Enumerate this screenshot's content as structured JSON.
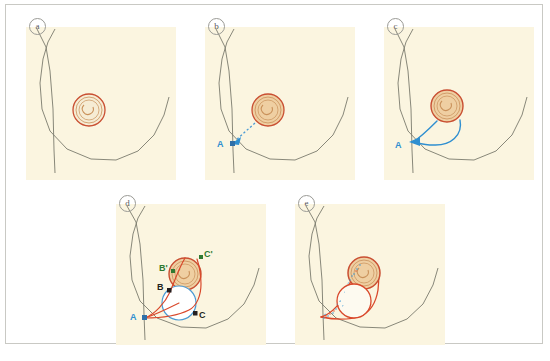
{
  "figure": {
    "type": "surgical-technique-diagram",
    "panel_count": 5,
    "background_color": "#ffffff",
    "frame_border_color": "#c9c9c4",
    "skin_fill_color": "#fbf5e0",
    "skin_outline_color": "#7b7a6d",
    "areola_outline_color": "#c94f32",
    "areola_fill_color": "#efcfa2",
    "areola_inner_color": "#c9915a",
    "marker_blue": "#2f8fd0",
    "marker_red": "#d9482b",
    "marker_green": "#2f7a32",
    "marker_dark": "#231f20",
    "stipple_color": "#3f9bd6"
  },
  "panels": [
    {
      "id": "a",
      "label": "a",
      "caption_letter": "a",
      "description": "Baseline breast outline with nipple-areola complex, no markings",
      "point_labels": []
    },
    {
      "id": "b",
      "label": "b",
      "caption_letter": "b",
      "description": "Dotted blue arrow from areola toward inferolateral point A",
      "point_labels": [
        {
          "text": "A",
          "color": "#2f8fd0"
        }
      ]
    },
    {
      "id": "c",
      "label": "c",
      "caption_letter": "c",
      "description": "Two blue curved incision lines converging at point A from the areola",
      "point_labels": [
        {
          "text": "A",
          "color": "#2f8fd0"
        }
      ]
    },
    {
      "id": "d",
      "label": "d",
      "caption_letter": "d",
      "description": "Geometric planning: points A, B, C on lesion circle and transposed points B-prime and C-prime on areola",
      "point_labels": [
        {
          "text": "A",
          "color": "#2f8fd0"
        },
        {
          "text": "B",
          "color": "#231f20"
        },
        {
          "text": "C",
          "color": "#231f20"
        },
        {
          "text": "B'",
          "color": "#2f7a32"
        },
        {
          "text": "C'",
          "color": "#2f7a32"
        }
      ]
    },
    {
      "id": "e",
      "label": "e",
      "caption_letter": "e",
      "description": "Final excision outline in red with stippled de-epithelialised area between areola and lesion",
      "point_labels": []
    }
  ]
}
